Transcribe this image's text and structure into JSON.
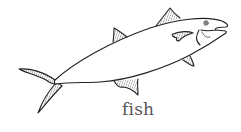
{
  "illustration": {
    "subject": "fish",
    "style": "line-drawing",
    "stroke_color": "#222222",
    "fill_color": "#ffffff"
  },
  "caption": {
    "text": "fish",
    "color": "#555555"
  }
}
